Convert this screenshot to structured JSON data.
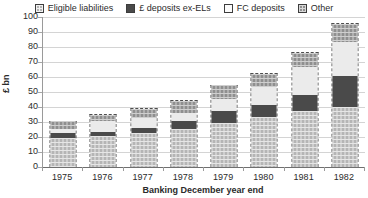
{
  "chart_data": {
    "type": "bar",
    "stacked": true,
    "title": "",
    "subtitle": "",
    "xlabel": "Banking December year end",
    "ylabel": "£ bn",
    "categories": [
      "1975",
      "1976",
      "1977",
      "1978",
      "1979",
      "1980",
      "1981",
      "1982"
    ],
    "series": [
      {
        "name": "Eligible liabilities",
        "key": "el",
        "color": "#b5b5b5",
        "pattern": "checker-light",
        "values": [
          19.5,
          21.0,
          23.0,
          26.0,
          29.5,
          34.0,
          38.0,
          40.0
        ]
      },
      {
        "name": "£ deposits ex-ELs",
        "key": "gbp",
        "color": "#4a4a4a",
        "pattern": "solid-dark",
        "values": [
          3.5,
          3.0,
          3.5,
          5.0,
          8.5,
          8.0,
          10.5,
          21.0
        ]
      },
      {
        "name": "FC deposits",
        "key": "fc",
        "color": "#ebebeb",
        "pattern": "solid-white",
        "values": [
          3.0,
          7.0,
          6.5,
          5.5,
          8.0,
          12.0,
          18.5,
          23.0
        ]
      },
      {
        "name": "Other",
        "key": "other",
        "color": "#8f8f8f",
        "pattern": "checker-mid",
        "values": [
          5.0,
          4.5,
          6.5,
          8.0,
          9.0,
          9.0,
          10.0,
          12.0
        ]
      }
    ],
    "totals": [
      31.0,
      35.5,
      39.5,
      44.5,
      55.0,
      63.0,
      77.0,
      96.0
    ],
    "ylim": [
      0,
      100
    ],
    "ytick_step": 10,
    "yticks": [
      "100",
      "90",
      "80",
      "70",
      "60",
      "50",
      "40",
      "30",
      "20",
      "10",
      "0"
    ],
    "grid": true,
    "grid_axis": "y",
    "legend_position": "top"
  },
  "legend": {
    "items": [
      {
        "label": "Eligible liabilities",
        "swatch": "el"
      },
      {
        "label": "£ deposits ex-ELs",
        "swatch": "gbp"
      },
      {
        "label": "FC deposits",
        "swatch": "fc"
      },
      {
        "label": "Other",
        "swatch": "other"
      }
    ]
  },
  "axes": {
    "y_axis_title": "£ bn",
    "x_axis_title": "Banking December year end"
  }
}
